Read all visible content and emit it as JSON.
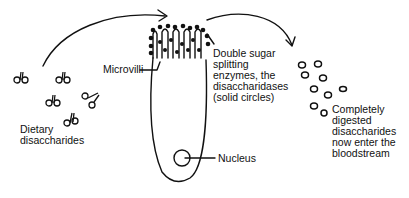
{
  "diagram": {
    "colors": {
      "ink": "#111111",
      "background": "#ffffff"
    },
    "labels": {
      "dietary": [
        "Dietary",
        "disaccharides"
      ],
      "microvilli": "Microvilli",
      "enzymes": [
        "Double sugar",
        "splitting",
        "enzymes, the",
        "disaccharidases",
        "(solid circles)"
      ],
      "digested": [
        "Completely",
        "digested",
        "disaccharides",
        "now enter the",
        "bloodstream"
      ],
      "nucleus": "Nucleus"
    },
    "nodes": [
      {
        "id": "dietary-disaccharides",
        "type": "molecule-group",
        "count": 5
      },
      {
        "id": "intestinal-cell",
        "type": "cell",
        "parts": [
          "microvilli",
          "disaccharidases",
          "nucleus"
        ]
      },
      {
        "id": "digested-sugars",
        "type": "molecule-group",
        "count": 9
      }
    ],
    "edges": [
      {
        "from": "dietary-disaccharides",
        "to": "intestinal-cell",
        "type": "curved-arrow"
      },
      {
        "from": "intestinal-cell",
        "to": "digested-sugars",
        "type": "curved-arrow"
      }
    ]
  }
}
